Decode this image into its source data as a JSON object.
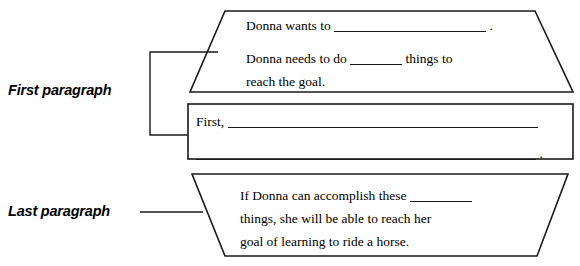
{
  "worksheet": {
    "labels": {
      "first_paragraph": "First paragraph",
      "last_paragraph": "Last paragraph"
    },
    "top_shape": {
      "shape": "trapezoid",
      "line1_before": "Donna wants to",
      "line1_blank": "",
      "line1_after": ".",
      "line2_before": "Donna needs to do",
      "line2_blank": "",
      "line2_after": "things to",
      "line3": "reach the goal."
    },
    "middle_shape": {
      "shape": "rectangle",
      "line1_before": "First,",
      "line1_blank": "",
      "line2_blank": "",
      "line2_after": "."
    },
    "bottom_shape": {
      "shape": "inverted-trapezoid",
      "line1_before": "If Donna can accomplish these",
      "line1_blank": "",
      "line2": "things, she will be able to reach her",
      "line3": "goal of learning to ride a horse."
    },
    "colors": {
      "stroke": "#1a1a1a",
      "background": "#ffffff",
      "text": "#000000"
    }
  }
}
